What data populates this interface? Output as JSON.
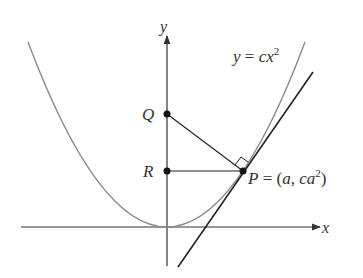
{
  "diagram": {
    "axes": {
      "x_label": "x",
      "y_label": "y"
    },
    "curve_label": {
      "lhs": "y",
      "eq": " = ",
      "rhs": "cx",
      "sup": "2"
    },
    "points": {
      "Q": {
        "label": "Q"
      },
      "R": {
        "label": "R"
      },
      "P": {
        "label": "P",
        "eq": " = (",
        "a": "a",
        "comma": ", ",
        "ca": "ca",
        "sup": "2",
        "close": ")"
      }
    },
    "colors": {
      "curve": "#8a8a8a",
      "lines": "#222222",
      "axis": "#333333"
    }
  }
}
